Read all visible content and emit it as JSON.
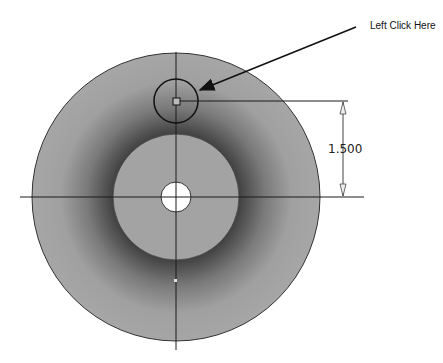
{
  "callout": {
    "label": "Left Click Here"
  },
  "dimension": {
    "value": "1.500"
  },
  "colors": {
    "face": "#a3a3a3",
    "face_shadow": "#3a3a3a",
    "hole": "#ffffff",
    "line": "#1a1a1a"
  },
  "geometry": {
    "center": [
      176,
      197
    ],
    "outer_radius": 144,
    "inner_boss_radius": 63,
    "center_hole_radius": 15,
    "sketch_circle_center": [
      176,
      101
    ],
    "sketch_circle_radius": 22
  }
}
